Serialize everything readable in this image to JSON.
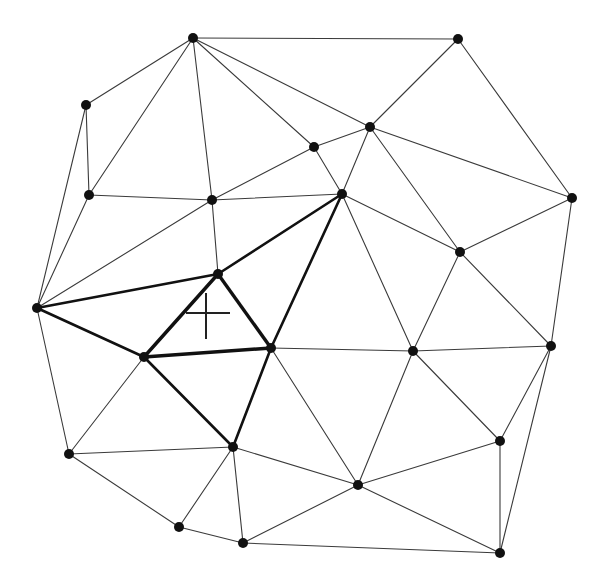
{
  "diagram": {
    "type": "triangulation",
    "colors": {
      "background": "#ffffff",
      "edge": "#3a3a3a",
      "highlight": "#111111",
      "node": "#111111"
    },
    "nodes": [
      {
        "id": 0,
        "x": 193,
        "y": 38
      },
      {
        "id": 1,
        "x": 458,
        "y": 39
      },
      {
        "id": 2,
        "x": 86,
        "y": 105
      },
      {
        "id": 3,
        "x": 370,
        "y": 127
      },
      {
        "id": 4,
        "x": 314,
        "y": 147
      },
      {
        "id": 5,
        "x": 89,
        "y": 195
      },
      {
        "id": 6,
        "x": 342,
        "y": 194
      },
      {
        "id": 7,
        "x": 572,
        "y": 198
      },
      {
        "id": 8,
        "x": 212,
        "y": 200
      },
      {
        "id": 9,
        "x": 460,
        "y": 252
      },
      {
        "id": 10,
        "x": 218,
        "y": 274
      },
      {
        "id": 11,
        "x": 37,
        "y": 308
      },
      {
        "id": 12,
        "x": 551,
        "y": 346
      },
      {
        "id": 13,
        "x": 271,
        "y": 348
      },
      {
        "id": 14,
        "x": 413,
        "y": 351
      },
      {
        "id": 15,
        "x": 144,
        "y": 357
      },
      {
        "id": 16,
        "x": 500,
        "y": 441
      },
      {
        "id": 17,
        "x": 233,
        "y": 447
      },
      {
        "id": 18,
        "x": 69,
        "y": 454
      },
      {
        "id": 19,
        "x": 358,
        "y": 485
      },
      {
        "id": 20,
        "x": 179,
        "y": 527
      },
      {
        "id": 21,
        "x": 243,
        "y": 543
      },
      {
        "id": 22,
        "x": 500,
        "y": 553
      }
    ],
    "edges": [
      {
        "a": 0,
        "b": 1,
        "style": "thin"
      },
      {
        "a": 0,
        "b": 2,
        "style": "thin"
      },
      {
        "a": 0,
        "b": 5,
        "style": "thin"
      },
      {
        "a": 0,
        "b": 8,
        "style": "thin"
      },
      {
        "a": 0,
        "b": 4,
        "style": "thin"
      },
      {
        "a": 0,
        "b": 3,
        "style": "thin"
      },
      {
        "a": 1,
        "b": 3,
        "style": "thin"
      },
      {
        "a": 1,
        "b": 7,
        "style": "thin"
      },
      {
        "a": 2,
        "b": 5,
        "style": "thin"
      },
      {
        "a": 2,
        "b": 11,
        "style": "thin"
      },
      {
        "a": 3,
        "b": 4,
        "style": "thin"
      },
      {
        "a": 3,
        "b": 6,
        "style": "thin"
      },
      {
        "a": 3,
        "b": 9,
        "style": "thin"
      },
      {
        "a": 3,
        "b": 7,
        "style": "thin"
      },
      {
        "a": 4,
        "b": 6,
        "style": "thin"
      },
      {
        "a": 4,
        "b": 8,
        "style": "thin"
      },
      {
        "a": 5,
        "b": 8,
        "style": "thin"
      },
      {
        "a": 5,
        "b": 11,
        "style": "thin"
      },
      {
        "a": 8,
        "b": 6,
        "style": "thin"
      },
      {
        "a": 8,
        "b": 10,
        "style": "thin"
      },
      {
        "a": 8,
        "b": 11,
        "style": "thin"
      },
      {
        "a": 6,
        "b": 9,
        "style": "thin"
      },
      {
        "a": 6,
        "b": 14,
        "style": "thin"
      },
      {
        "a": 6,
        "b": 10,
        "style": "bold"
      },
      {
        "a": 6,
        "b": 13,
        "style": "bold"
      },
      {
        "a": 7,
        "b": 9,
        "style": "thin"
      },
      {
        "a": 7,
        "b": 12,
        "style": "thin"
      },
      {
        "a": 9,
        "b": 14,
        "style": "thin"
      },
      {
        "a": 9,
        "b": 12,
        "style": "thin"
      },
      {
        "a": 10,
        "b": 11,
        "style": "bold"
      },
      {
        "a": 10,
        "b": 15,
        "style": "bolder"
      },
      {
        "a": 10,
        "b": 13,
        "style": "bolder"
      },
      {
        "a": 15,
        "b": 13,
        "style": "bolder"
      },
      {
        "a": 11,
        "b": 15,
        "style": "bold"
      },
      {
        "a": 11,
        "b": 18,
        "style": "thin"
      },
      {
        "a": 15,
        "b": 17,
        "style": "bold"
      },
      {
        "a": 13,
        "b": 17,
        "style": "bold"
      },
      {
        "a": 15,
        "b": 18,
        "style": "thin"
      },
      {
        "a": 13,
        "b": 14,
        "style": "thin"
      },
      {
        "a": 13,
        "b": 19,
        "style": "thin"
      },
      {
        "a": 14,
        "b": 19,
        "style": "thin"
      },
      {
        "a": 14,
        "b": 12,
        "style": "thin"
      },
      {
        "a": 14,
        "b": 16,
        "style": "thin"
      },
      {
        "a": 12,
        "b": 16,
        "style": "thin"
      },
      {
        "a": 12,
        "b": 22,
        "style": "thin"
      },
      {
        "a": 16,
        "b": 22,
        "style": "thin"
      },
      {
        "a": 16,
        "b": 19,
        "style": "thin"
      },
      {
        "a": 17,
        "b": 18,
        "style": "thin"
      },
      {
        "a": 17,
        "b": 19,
        "style": "thin"
      },
      {
        "a": 17,
        "b": 20,
        "style": "thin"
      },
      {
        "a": 17,
        "b": 21,
        "style": "thin"
      },
      {
        "a": 18,
        "b": 20,
        "style": "thin"
      },
      {
        "a": 20,
        "b": 21,
        "style": "thin"
      },
      {
        "a": 21,
        "b": 19,
        "style": "thin"
      },
      {
        "a": 21,
        "b": 22,
        "style": "thin"
      },
      {
        "a": 19,
        "b": 22,
        "style": "thin"
      }
    ],
    "query_point": {
      "x": 206,
      "y": 313,
      "marker": "cross",
      "half_width": 22,
      "half_height": 22
    },
    "highlighted_triangle": [
      10,
      15,
      13
    ]
  }
}
